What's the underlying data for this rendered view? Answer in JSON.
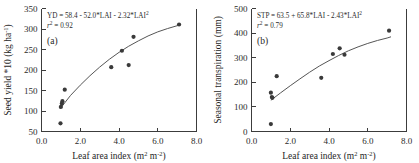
{
  "figure": {
    "panel_count": 2
  },
  "chart_data": [
    {
      "type": "scatter",
      "panel_label": "(a)",
      "title": "",
      "xlabel": "Leaf area index (m",
      "xlabel_sup1": "2",
      "xlabel_mid": " m",
      "xlabel_sup2": "-2",
      "xlabel_end": ")",
      "ylabel": "Seed yield *10 (kg ha",
      "ylabel_sup": "-1",
      "ylabel_end": ")",
      "xlim": [
        0.0,
        8.0
      ],
      "ylim": [
        50,
        350
      ],
      "xticks": [
        "0.0",
        "2.0",
        "4.0",
        "6.0",
        "8.0"
      ],
      "xtick_values": [
        0.0,
        2.0,
        4.0,
        6.0,
        8.0
      ],
      "yticks": [
        "50",
        "100",
        "150",
        "200",
        "250",
        "300",
        "350"
      ],
      "ytick_values": [
        50,
        100,
        150,
        200,
        250,
        300,
        350
      ],
      "grid": false,
      "legend": "none",
      "equation": "YD = 58.4 - 52.0*LAI - 2.32*LAI",
      "equation_sup": "2",
      "r2_symbol": "r",
      "r2_sup": "2",
      "r2_text": " = 0.92",
      "r2_value": 0.92,
      "fit": {
        "form": "quadratic",
        "intercept": 58.4,
        "linear": -52.0,
        "quadratic": -2.32,
        "drawn_curve_x": [
          0.95,
          1.5,
          2.0,
          2.5,
          3.0,
          3.5,
          4.0,
          4.5,
          5.0,
          5.5,
          6.0,
          6.5,
          7.0,
          7.2
        ],
        "drawn_curve_y": [
          105,
          138,
          163,
          186,
          207,
          226,
          243,
          258,
          271,
          283,
          293,
          301,
          308,
          311
        ]
      },
      "points": [
        {
          "x": 0.98,
          "y": 70
        },
        {
          "x": 1.0,
          "y": 110
        },
        {
          "x": 1.05,
          "y": 118
        },
        {
          "x": 1.08,
          "y": 124
        },
        {
          "x": 1.2,
          "y": 152
        },
        {
          "x": 3.6,
          "y": 207
        },
        {
          "x": 4.15,
          "y": 247
        },
        {
          "x": 4.5,
          "y": 212
        },
        {
          "x": 4.75,
          "y": 281
        },
        {
          "x": 7.1,
          "y": 311
        }
      ]
    },
    {
      "type": "scatter",
      "panel_label": "(b)",
      "title": "",
      "xlabel": "Leaf area index (m",
      "xlabel_sup1": "2",
      "xlabel_mid": " m",
      "xlabel_sup2": "-2",
      "xlabel_end": ")",
      "ylabel": "Seasonal transpiration (mm)",
      "ylabel_sup": "",
      "ylabel_end": "",
      "xlim": [
        0.0,
        8.0
      ],
      "ylim": [
        0,
        500
      ],
      "xticks": [
        "0.0",
        "2.0",
        "4.0",
        "6.0",
        "8.0"
      ],
      "xtick_values": [
        0.0,
        2.0,
        4.0,
        6.0,
        8.0
      ],
      "yticks": [
        "0",
        "100",
        "200",
        "300",
        "400",
        "500"
      ],
      "ytick_values": [
        0,
        100,
        200,
        300,
        400,
        500
      ],
      "grid": false,
      "legend": "none",
      "equation": "STP = 63.5 + 65.8*LAI - 2.43*LAI",
      "equation_sup": "2",
      "r2_symbol": "r",
      "r2_sup": "2",
      "r2_text": " = 0.79",
      "r2_value": 0.79,
      "fit": {
        "form": "quadratic",
        "intercept": 63.5,
        "linear": 65.8,
        "quadratic": -2.43,
        "drawn_curve_x": [
          1.0,
          1.5,
          2.0,
          2.5,
          3.0,
          3.5,
          4.0,
          4.5,
          5.0,
          5.5,
          6.0,
          6.5,
          7.0,
          7.2
        ],
        "drawn_curve_y": [
          127,
          157,
          186,
          214,
          241,
          266,
          288,
          309,
          328,
          344,
          358,
          370,
          380,
          385
        ]
      },
      "points": [
        {
          "x": 1.0,
          "y": 30
        },
        {
          "x": 1.0,
          "y": 158
        },
        {
          "x": 1.05,
          "y": 140
        },
        {
          "x": 1.08,
          "y": 137
        },
        {
          "x": 1.3,
          "y": 225
        },
        {
          "x": 3.6,
          "y": 218
        },
        {
          "x": 4.2,
          "y": 315
        },
        {
          "x": 4.55,
          "y": 338
        },
        {
          "x": 4.8,
          "y": 312
        },
        {
          "x": 7.1,
          "y": 410
        }
      ]
    }
  ]
}
